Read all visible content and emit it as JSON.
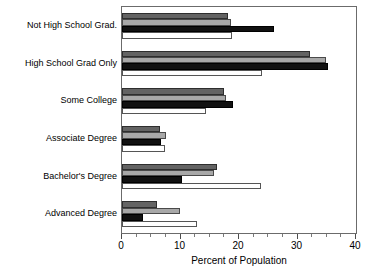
{
  "chart_data": {
    "type": "bar",
    "orientation": "horizontal",
    "title": "",
    "xlabel": "Percent of Population",
    "ylabel": "",
    "xlim": [
      0,
      40
    ],
    "xticks": [
      0,
      10,
      20,
      30,
      40
    ],
    "xticklabels": [
      "0",
      "10",
      "20",
      "30",
      "40"
    ],
    "xminorticks": [
      2.5,
      5,
      7.5,
      12.5,
      15,
      17.5,
      22.5,
      25,
      27.5,
      32.5,
      35,
      37.5
    ],
    "grid": false,
    "legend": "none",
    "categories": [
      "Not High School Grad.",
      "High School Grad Only",
      "Some College",
      "Associate Degree",
      "Bachelor's Degree",
      "Advanced Degree"
    ],
    "series": [
      {
        "name": "series-1",
        "color": "#636363",
        "values": [
          18.2,
          32.2,
          17.4,
          6.5,
          16.2,
          6.0
        ]
      },
      {
        "name": "series-2",
        "color": "#a8a8a8",
        "values": [
          18.6,
          34.9,
          17.7,
          7.5,
          15.8,
          9.9
        ]
      },
      {
        "name": "series-3",
        "color": "#111111",
        "values": [
          26.0,
          35.2,
          18.9,
          6.6,
          10.2,
          3.6
        ]
      },
      {
        "name": "series-4",
        "color": "#ffffff",
        "values": [
          18.8,
          24.0,
          14.3,
          7.3,
          23.7,
          12.8
        ]
      }
    ]
  }
}
